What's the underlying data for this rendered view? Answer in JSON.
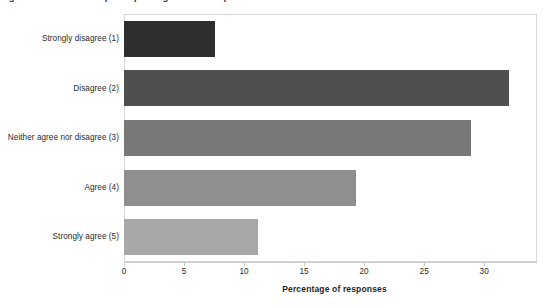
{
  "top_clipped_text": "Figure: Distribution of participant agreement responses",
  "chart_data": {
    "type": "bar",
    "orientation": "horizontal",
    "title": "",
    "subtitle": "",
    "xlabel": "Percentage of responses",
    "ylabel": "",
    "categories": [
      "Strongly disagree (1)",
      "Disagree (2)",
      "Neither agree nor disagree (3)",
      "Agree (4)",
      "Strongly agree (5)"
    ],
    "values": [
      7.6,
      32.1,
      28.9,
      19.3,
      11.2
    ],
    "bar_colors": [
      "#2e2e2e",
      "#4f4f4f",
      "#787878",
      "#8f8f8f",
      "#a8a8a8"
    ],
    "xlim": [
      0,
      34.4
    ],
    "xticks": [
      0,
      5,
      10,
      15,
      20,
      25,
      30
    ],
    "xticklabels": [
      "0",
      "5",
      "10",
      "15",
      "20",
      "25",
      "30"
    ],
    "grid": false,
    "legend": null,
    "legend_position": "none",
    "plot_border_color": "#d6d6d6",
    "axis_color": "#c9c9c9",
    "background": "#ffffff"
  }
}
